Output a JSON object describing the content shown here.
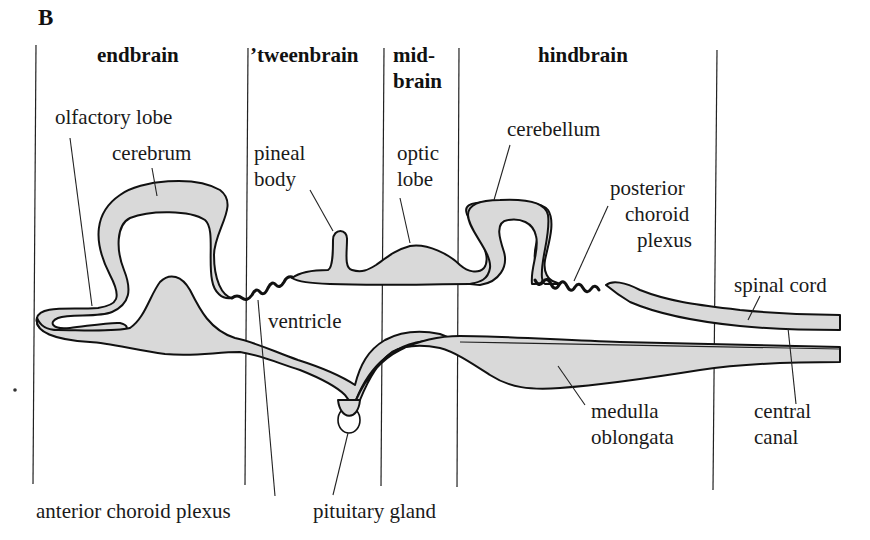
{
  "figure": {
    "panel_label": "B",
    "regions": [
      {
        "name": "endbrain",
        "lines": [
          "endbrain"
        ]
      },
      {
        "name": "tweenbrain",
        "lines": [
          "’tweenbrain"
        ]
      },
      {
        "name": "midbrain",
        "lines": [
          "mid-",
          "brain"
        ]
      },
      {
        "name": "hindbrain",
        "lines": [
          "hindbrain"
        ]
      }
    ],
    "labels": {
      "olfactory_lobe": [
        "olfactory lobe"
      ],
      "cerebrum": [
        "cerebrum"
      ],
      "pineal_body": [
        "pineal",
        "body"
      ],
      "optic_lobe": [
        "optic",
        "lobe"
      ],
      "cerebellum": [
        "cerebellum"
      ],
      "posterior_choroid_plexus": [
        "posterior",
        "choroid",
        "plexus"
      ],
      "spinal_cord": [
        "spinal cord"
      ],
      "ventricle": [
        "ventricle"
      ],
      "medulla_oblongata": [
        "medulla",
        "oblongata"
      ],
      "central_canal": [
        "central",
        "canal"
      ],
      "anterior_choroid_plexus": [
        "anterior choroid plexus"
      ],
      "pituitary_gland": [
        "pituitary gland"
      ]
    },
    "colors": {
      "tissue_fill": "#d9d9d9",
      "outline": "#111111",
      "background": "#ffffff"
    }
  }
}
